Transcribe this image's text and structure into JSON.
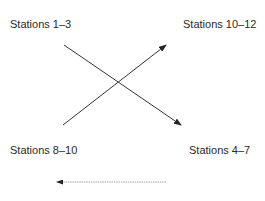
{
  "diagram": {
    "nodes": [
      {
        "id": "tl",
        "label": "Stations 1–3"
      },
      {
        "id": "tr",
        "label": "Stations 10–12"
      },
      {
        "id": "bl",
        "label": "Stations 8–10"
      },
      {
        "id": "br",
        "label": "Stations 4–7"
      }
    ],
    "edges": [
      {
        "from": "Stations 1–3",
        "to": "Stations 4–7",
        "style": "solid"
      },
      {
        "from": "Stations 8–10",
        "to": "Stations 10–12",
        "style": "solid"
      },
      {
        "from": "right",
        "to": "left",
        "style": "dotted",
        "position": "bottom"
      }
    ],
    "colors": {
      "line": "#333333",
      "dotted_line": "#9a9a9a",
      "text": "#2a2a2a"
    }
  }
}
